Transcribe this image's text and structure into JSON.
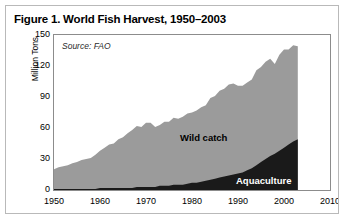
{
  "figure": {
    "title": "Figure 1. World Fish Harvest, 1950–2003",
    "source_note": "Source: FAO",
    "border_color": "#b9b9b9",
    "background": "#ffffff"
  },
  "chart_data": {
    "type": "area",
    "title": "Figure 1. World Fish Harvest, 1950–2003",
    "subtitle": "Source: FAO",
    "xlabel": "",
    "ylabel": "Million Tons",
    "xlim": [
      1950,
      2010
    ],
    "ylim": [
      0,
      150
    ],
    "xticks": [
      1950,
      1960,
      1970,
      1980,
      1990,
      2000,
      2010
    ],
    "yticks": [
      0,
      30,
      60,
      90,
      120,
      150
    ],
    "grid": false,
    "legend_position": "inline-annotation",
    "stacked": true,
    "colors": {
      "wild_catch": "#9b9b9b",
      "aquaculture": "#1a1a1a",
      "axis": "#8c8c8c",
      "text": "#000000"
    },
    "annotations": [
      {
        "text": "Wild catch",
        "series": "Wild catch",
        "x": 1988,
        "y": 78
      },
      {
        "text": "Aquaculture",
        "series": "Aquaculture",
        "x": 2000,
        "y": 18
      }
    ],
    "x": [
      1950,
      1951,
      1952,
      1953,
      1954,
      1955,
      1956,
      1957,
      1958,
      1959,
      1960,
      1961,
      1962,
      1963,
      1964,
      1965,
      1966,
      1967,
      1968,
      1969,
      1970,
      1971,
      1972,
      1973,
      1974,
      1975,
      1976,
      1977,
      1978,
      1979,
      1980,
      1981,
      1982,
      1983,
      1984,
      1985,
      1986,
      1987,
      1988,
      1989,
      1990,
      1991,
      1992,
      1993,
      1994,
      1995,
      1996,
      1997,
      1998,
      1999,
      2000,
      2001,
      2002,
      2003
    ],
    "series": [
      {
        "name": "Wild catch",
        "color": "#9b9b9b",
        "values": [
          19,
          21,
          22,
          23,
          25,
          26,
          28,
          29,
          30,
          33,
          36,
          39,
          42,
          43,
          47,
          49,
          53,
          56,
          59,
          58,
          62,
          62,
          58,
          59,
          62,
          62,
          65,
          64,
          66,
          68,
          68,
          70,
          72,
          73,
          79,
          80,
          84,
          85,
          88,
          88,
          85,
          84,
          85,
          86,
          92,
          92,
          94,
          94,
          87,
          93,
          95,
          92,
          93,
          90
        ]
      },
      {
        "name": "Aquaculture",
        "color": "#1a1a1a",
        "values": [
          1,
          1,
          1,
          1,
          1,
          1,
          1,
          1,
          1,
          1,
          2,
          2,
          2,
          2,
          2,
          2,
          2,
          2,
          3,
          3,
          3,
          3,
          3,
          4,
          4,
          4,
          5,
          5,
          5,
          6,
          7,
          7,
          8,
          9,
          10,
          11,
          12,
          13,
          14,
          15,
          16,
          17,
          19,
          21,
          24,
          27,
          30,
          33,
          35,
          38,
          41,
          44,
          47,
          49
        ]
      }
    ],
    "total": [
      20,
      22,
      23,
      24,
      26,
      27,
      29,
      30,
      31,
      34,
      38,
      41,
      44,
      45,
      49,
      51,
      55,
      58,
      62,
      61,
      65,
      65,
      61,
      63,
      66,
      66,
      70,
      69,
      71,
      74,
      75,
      77,
      80,
      82,
      89,
      91,
      96,
      98,
      102,
      103,
      101,
      101,
      104,
      107,
      116,
      119,
      124,
      127,
      122,
      131,
      136,
      136,
      140,
      139
    ]
  }
}
